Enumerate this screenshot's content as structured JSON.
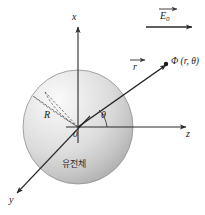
{
  "figure": {
    "background_color": "#ffffff",
    "line_color": "#2a2a2a",
    "sphere": {
      "fill_light": "#f2f2f2",
      "fill_mid": "#d8d8d8",
      "fill_dark": "#b4b4b4",
      "edge_color": "#8c8c8c",
      "center_x": 78,
      "center_y": 127,
      "radius_x": 55,
      "radius_y": 57
    }
  },
  "axes": {
    "x": {
      "label": "x",
      "direction": "up"
    },
    "y": {
      "label": "y",
      "direction": "down-left"
    },
    "z": {
      "label": "z",
      "direction": "right"
    },
    "origin_label": "0"
  },
  "vectors": {
    "external_field": {
      "label": "E",
      "subscript": "0",
      "has_arrow_accent": true,
      "direction": "right"
    },
    "position": {
      "label": "r",
      "has_arrow_accent": true,
      "direction": "up-right"
    }
  },
  "annotations": {
    "radius": {
      "label": "R"
    },
    "angle": {
      "label": "θ"
    },
    "field_point": {
      "label": "Φ (r, θ)"
    },
    "material": {
      "label": "유전체"
    }
  }
}
